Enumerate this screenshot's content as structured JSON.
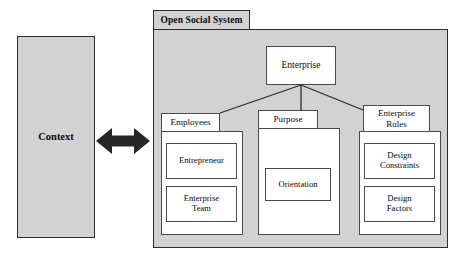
{
  "diagram": {
    "colors": {
      "shaded_fill": "#d2d2d2",
      "white_fill": "#ffffff",
      "outline_dark": "#2b2b2b",
      "outline_light": "#4a4a4a",
      "arrow_fill": "#262626",
      "text": "#0a0a0a"
    }
  },
  "context": {
    "label": "Context"
  },
  "relation": {
    "arrow_icon": "double-headed-arrow",
    "direction": "bidirectional"
  },
  "open_social_system": {
    "tab_label": "Open Social System",
    "enterprise": {
      "label": "Enterprise"
    },
    "groups": [
      {
        "tab_label": "Employees",
        "children": [
          {
            "label": "Entrepreneur"
          },
          {
            "label": "Enterprise\nTeam"
          }
        ]
      },
      {
        "tab_label": "Purpose",
        "children": [
          {
            "label": "Orientation"
          }
        ]
      },
      {
        "tab_label": "Enterprise\nRules",
        "children": [
          {
            "label": "Design\nConstraints"
          },
          {
            "label": "Design\nFactors"
          }
        ]
      }
    ]
  }
}
